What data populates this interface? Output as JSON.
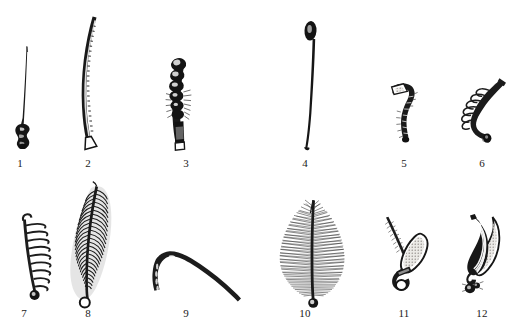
{
  "plate": {
    "title": "",
    "background_color": "#ffffff",
    "ink_color": "#141414",
    "width": 517,
    "height": 331,
    "description": "Scientific line-engraving plate of twelve numbered bristle / seta specimens arranged in two rows of six",
    "rows": 2,
    "columns": 6
  },
  "specimens": [
    {
      "number": "1",
      "name": "capillary-seta-with-bulbous-base",
      "label": "1",
      "row": 1,
      "column": 1,
      "label_x": 20,
      "label_y": 157,
      "shape": "slender tapering capillary shaft rising from a swollen knobbed basal bulb"
    },
    {
      "number": "2",
      "name": "long-curved-annulated-seta",
      "label": "2",
      "row": 1,
      "column": 2,
      "label_x": 88,
      "label_y": 157,
      "shape": "long gently S-curved ladder-annulated shaft with flared spade-shaped foot"
    },
    {
      "number": "3",
      "name": "moniliform-beaded-seta",
      "label": "3",
      "row": 1,
      "column": 3,
      "label_x": 186,
      "label_y": 157,
      "shape": "beaded moniliform chain of rounded swellings with fine lateral hairs and a cylindrical base"
    },
    {
      "number": "4",
      "name": "capitate-headed-seta",
      "label": "4",
      "row": 1,
      "column": 4,
      "label_x": 305,
      "label_y": 157,
      "shape": "very long smooth slender shaft terminating in a small ovoid capitate head"
    },
    {
      "number": "5",
      "name": "hooked-spinose-seta",
      "label": "5",
      "row": 1,
      "column": 5,
      "label_x": 404,
      "label_y": 157,
      "shape": "sigmoid hooked rod with pale triangular tip and short spinous collar"
    },
    {
      "number": "6",
      "name": "pinnate-branched-seta",
      "label": "6",
      "row": 1,
      "column": 6,
      "label_x": 482,
      "label_y": 157,
      "shape": "angular shaft bearing a row of loop-like pinnate lateral branches"
    },
    {
      "number": "7",
      "name": "pectinate-comb-seta",
      "label": "7",
      "row": 2,
      "column": 1,
      "label_x": 24,
      "label_y": 307,
      "shape": "slender axis with widely spaced comb-like lateral teeth and a small basal knob"
    },
    {
      "number": "8",
      "name": "plumose-feather-seta",
      "label": "8",
      "row": 2,
      "column": 2,
      "label_x": 88,
      "label_y": 307,
      "shape": "broad leaf-shaped plumose blade of dense parallel barbs on a central rachis, open ring base"
    },
    {
      "number": "9",
      "name": "bent-arcuate-seta",
      "label": "9",
      "row": 2,
      "column": 3,
      "label_x": 186,
      "label_y": 307,
      "shape": "strongly bent arcuate rod, thick at the angle and tapering to a fine point"
    },
    {
      "number": "10",
      "name": "dense-plumose-brush-seta",
      "label": "10",
      "row": 2,
      "column": 4,
      "label_x": 305,
      "label_y": 307,
      "shape": "bushy conical brush of very dense fine radiating filaments on a short stalk"
    },
    {
      "number": "11",
      "name": "paddle-blade-seta",
      "label": "11",
      "row": 2,
      "column": 5,
      "label_x": 404,
      "label_y": 307,
      "shape": "oval pale paddle-like blade beside a fine spinous bristle, both on a hooked base"
    },
    {
      "number": "12",
      "name": "fan-lamellate-seta",
      "label": "12",
      "row": 2,
      "column": 6,
      "label_x": 482,
      "label_y": 307,
      "shape": "curved fan of several overlapping lamellar blades on a knotted base"
    }
  ]
}
